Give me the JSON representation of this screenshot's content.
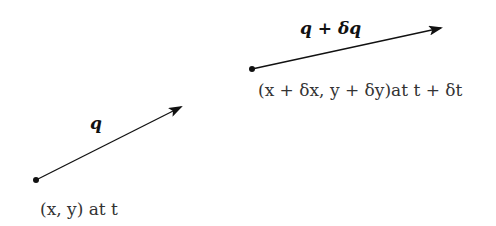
{
  "vectors": [
    {
      "name": "q",
      "label": "q",
      "start_label": "(x, y) at t",
      "start": [
        36,
        180
      ],
      "end": [
        181,
        107
      ]
    },
    {
      "name": "q-plus-dq",
      "label": "q + δq",
      "start_label": "(x + δx, y + δy)at  t + δt",
      "start": [
        252,
        69
      ],
      "end": [
        441,
        28
      ]
    }
  ],
  "colors": {
    "line": "#111111",
    "text": "#333333"
  }
}
